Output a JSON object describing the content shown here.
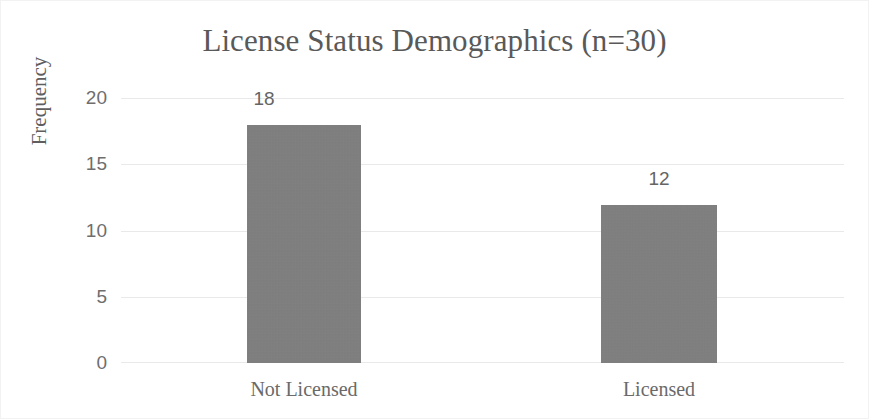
{
  "chart_data": {
    "type": "bar",
    "title": "License Status Demographics (n=30)",
    "xlabel": "",
    "ylabel": "Frequency",
    "categories": [
      "Not Licensed",
      "Licensed"
    ],
    "values": [
      18,
      12
    ],
    "data_labels": [
      "18",
      "12"
    ],
    "ylim": [
      0,
      20
    ],
    "yticks": [
      0,
      5,
      10,
      15,
      20
    ],
    "ytick_labels": [
      "0",
      "5",
      "10",
      "15",
      "20"
    ],
    "grid": "horizontal",
    "legend": "none",
    "bar_color": "#7f7f7f",
    "gridline_color": "#e9e9e9",
    "text_color": "#595959"
  }
}
